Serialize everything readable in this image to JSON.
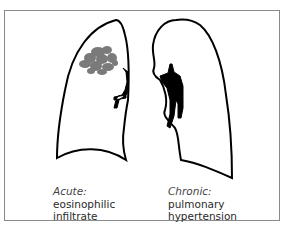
{
  "figure": {
    "left_panel": {
      "heading": "Acute:",
      "line1": "eosinophilic",
      "line2": "infiltrate"
    },
    "right_panel": {
      "heading": "Chronic:",
      "line1": "pulmonary",
      "line2": "hypertension"
    },
    "colors": {
      "outline": "#000000",
      "infiltrate": "#7a7a7a",
      "frame": "#8a8a8a"
    }
  }
}
